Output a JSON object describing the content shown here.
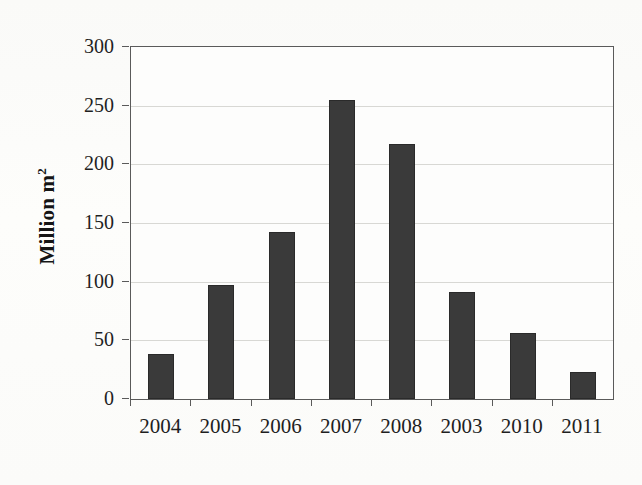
{
  "chart_data": {
    "type": "bar",
    "title": "",
    "subtitle": "",
    "xlabel": "",
    "ylabel": "Million m",
    "ylabel_superscript": "2",
    "categories": [
      "2004",
      "2005",
      "2006",
      "2007",
      "2008",
      "2003",
      "2010",
      "2011"
    ],
    "values": [
      38,
      97,
      142,
      255,
      217,
      91,
      56,
      23
    ],
    "series": [
      {
        "name": "Million m2",
        "values": [
          38,
          97,
          142,
          255,
          217,
          91,
          56,
          23
        ]
      }
    ],
    "ylim": [
      0,
      300
    ],
    "yticks": [
      0,
      50,
      100,
      150,
      200,
      250,
      300
    ],
    "ytick_labels": [
      "0",
      "50",
      "100",
      "150",
      "200",
      "250",
      "300"
    ],
    "grid": true,
    "grid_axis": "y",
    "legend": false,
    "legend_position": "none",
    "bar_color": "#3a3a3a",
    "bar_edge_color": "#2a2a2a",
    "gridline_color": "#d8d8d4",
    "axis_color": "#5a5a5a",
    "background_color": "#fdfdfb",
    "text_color": "#1f1f1f",
    "annotations": []
  }
}
